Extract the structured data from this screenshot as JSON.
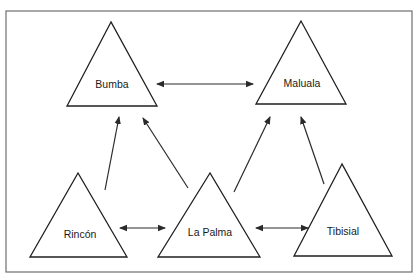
{
  "diagram": {
    "frame": {
      "x": 6,
      "y": 11,
      "width": 406,
      "height": 261,
      "color": "#6e6e6e"
    },
    "nodes": [
      {
        "id": "bumba",
        "label": "Bumba",
        "apex": [
          111,
          22
        ],
        "base_left": [
          67,
          106
        ],
        "base_right": [
          157,
          106
        ],
        "label_pos": [
          112,
          85
        ]
      },
      {
        "id": "maluala",
        "label": "Maluala",
        "apex": [
          301,
          21
        ],
        "base_left": [
          256,
          104
        ],
        "base_right": [
          346,
          104
        ],
        "label_pos": [
          302,
          84
        ]
      },
      {
        "id": "rincon",
        "label": "Rincón",
        "apex": [
          78,
          173
        ],
        "base_left": [
          30,
          257
        ],
        "base_right": [
          127,
          257
        ],
        "label_pos": [
          80,
          235
        ]
      },
      {
        "id": "la-palma",
        "label": "La Palma",
        "apex": [
          210,
          173
        ],
        "base_left": [
          158,
          257
        ],
        "base_right": [
          260,
          257
        ],
        "label_pos": [
          210,
          233
        ]
      },
      {
        "id": "tibisial",
        "label": "Tibisial",
        "apex": [
          342,
          164
        ],
        "base_left": [
          294,
          256
        ],
        "base_right": [
          392,
          256
        ],
        "label_pos": [
          343,
          232
        ]
      }
    ],
    "edges": [
      {
        "from": "bumba",
        "to": "maluala",
        "type": "bidirectional",
        "x1": 157,
        "y1": 84,
        "x2": 253,
        "y2": 84
      },
      {
        "from": "rincon",
        "to": "bumba",
        "type": "directed",
        "x1": 105,
        "y1": 190,
        "x2": 119,
        "y2": 117
      },
      {
        "from": "la-palma",
        "to": "bumba",
        "type": "directed",
        "x1": 188,
        "y1": 188,
        "x2": 143,
        "y2": 118
      },
      {
        "from": "la-palma",
        "to": "maluala",
        "type": "directed",
        "x1": 234,
        "y1": 192,
        "x2": 270,
        "y2": 117
      },
      {
        "from": "tibisial",
        "to": "maluala",
        "type": "directed",
        "x1": 324,
        "y1": 184,
        "x2": 301,
        "y2": 117
      },
      {
        "from": "rincon",
        "to": "la-palma",
        "type": "bidirectional",
        "x1": 120,
        "y1": 228,
        "x2": 165,
        "y2": 228
      },
      {
        "from": "la-palma",
        "to": "tibisial",
        "type": "bidirectional",
        "x1": 256,
        "y1": 228,
        "x2": 308,
        "y2": 228
      }
    ],
    "colors": {
      "stroke": "#1f1f1f",
      "arrow": "#2a2a2a",
      "background": "#ffffff"
    }
  }
}
